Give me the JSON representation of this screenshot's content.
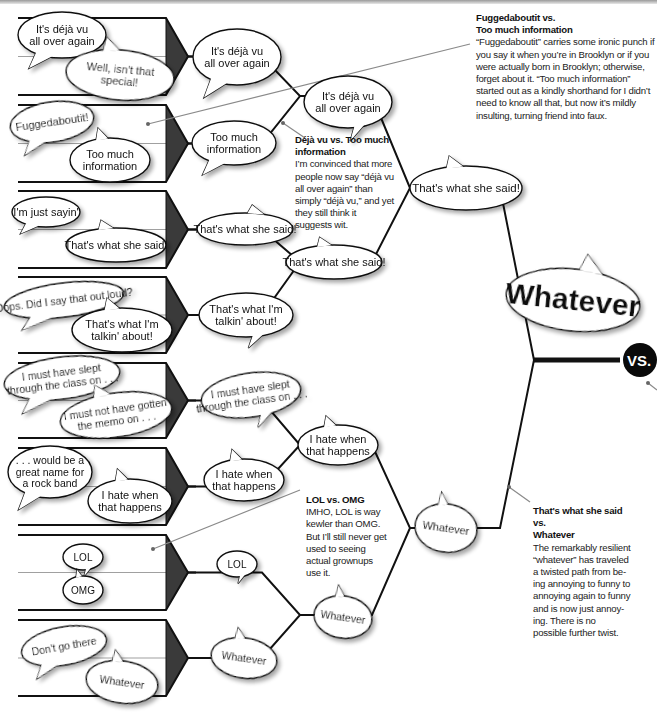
{
  "bracket": {
    "round1": [
      {
        "a": [
          "It's déjà vu",
          "all over again"
        ],
        "b": [
          "Well, isn't that",
          "special!"
        ]
      },
      {
        "a": [
          "Fuggedaboutit!"
        ],
        "b": [
          "Too much",
          "information"
        ]
      },
      {
        "a": [
          "I'm just sayin'"
        ],
        "b": [
          "That's what she said!"
        ]
      },
      {
        "a": [
          "Oops. Did I say that out loud?"
        ],
        "b": [
          "That's what I'm",
          "talkin' about!"
        ]
      },
      {
        "a": [
          "I must have slept",
          "through the class on . . ."
        ],
        "b": [
          "I must not have gotten",
          "the memo on . . ."
        ]
      },
      {
        "a": [
          ". . . would be a",
          "great name for",
          "a rock band"
        ],
        "b": [
          "I hate when",
          "that happens"
        ]
      },
      {
        "a": [
          "LOL"
        ],
        "b": [
          "OMG"
        ]
      },
      {
        "a": [
          "Don't go there"
        ],
        "b": [
          "Whatever"
        ]
      }
    ],
    "round2": [
      [
        "It's déjà vu",
        "all over again"
      ],
      [
        "Too much",
        "information"
      ],
      [
        "That's what she said!"
      ],
      [
        "That's what I'm",
        "talkin' about!"
      ],
      [
        "I must have slept",
        "through the class on . . ."
      ],
      [
        "I hate when",
        "that happens"
      ],
      [
        "LOL"
      ],
      [
        "Whatever"
      ]
    ],
    "round3": [
      [
        "It's déjà vu",
        "all over again"
      ],
      [
        "That's what she said!"
      ],
      [
        "I hate when",
        "that happens"
      ],
      [
        "Whatever"
      ]
    ],
    "semifinals": [
      [
        "That's what she said!"
      ],
      [
        "Whatever"
      ]
    ],
    "winner": "Whatever",
    "vs_label": "VS."
  },
  "notes": [
    {
      "heading_lines": [
        "Fuggedaboutit vs.",
        "Too much information"
      ],
      "body": "“Fuggedaboutit” carries some ironic punch if you say it when you’re in Brooklyn or if you were actually born in Brooklyn; otherwise, forget about it. “Too much information” started out as a kindly shorthand for I didn’t need to know all that, but now it’s mildly insulting, turning friend into faux."
    },
    {
      "heading_lines": [
        "Déjà vu vs. Too much",
        "information"
      ],
      "body": "I’m convinced that more people now say “déjà vu all over again” than simply “déjà vu,” and yet they still think it suggests wit."
    },
    {
      "heading_lines": [
        "LOL vs. OMG"
      ],
      "body": "IMHO, LOL is way kewler than OMG. But I’ll still never get used to seeing actual grownups use it."
    },
    {
      "heading_lines": [
        "That's what she said vs.",
        "Whatever"
      ],
      "body": "The remarkably resilient “whatever” has traveled a twisted path from be-ing annoying to funny to annoying again to funny and is now just annoy-ing. There is no possible further twist."
    }
  ],
  "colors": {
    "line": "#111111",
    "pentagon_fill": "#3a3a3a",
    "bubble_fill": "#ffffff",
    "shadow": "#bdbdbd",
    "leader": "#8a8a8a",
    "vs_bg": "#0a0a0a",
    "vs_text": "#ffffff"
  }
}
